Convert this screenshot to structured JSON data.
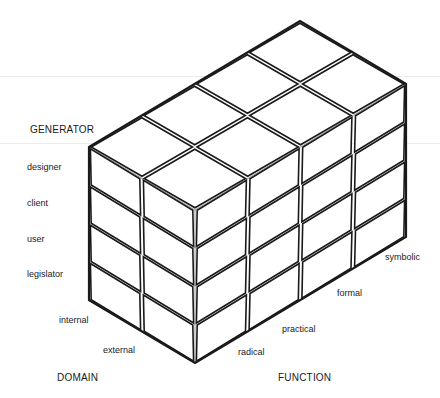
{
  "diagram": {
    "type": "isometric-block-matrix",
    "dimensions": {
      "generator_rows": 4,
      "domain_depth": 2,
      "function_columns": 4
    },
    "colors": {
      "line": "#1a1a1a",
      "face": "#ffffff",
      "thin_edge": "#555555"
    }
  },
  "axes": {
    "generator": {
      "title": "GENERATOR",
      "items": [
        "designer",
        "client",
        "user",
        "legislator"
      ]
    },
    "domain": {
      "title": "DOMAIN",
      "items": [
        "internal",
        "external"
      ]
    },
    "function": {
      "title": "FUNCTION",
      "items": [
        "radical",
        "practical",
        "formal",
        "symbolic"
      ]
    }
  }
}
